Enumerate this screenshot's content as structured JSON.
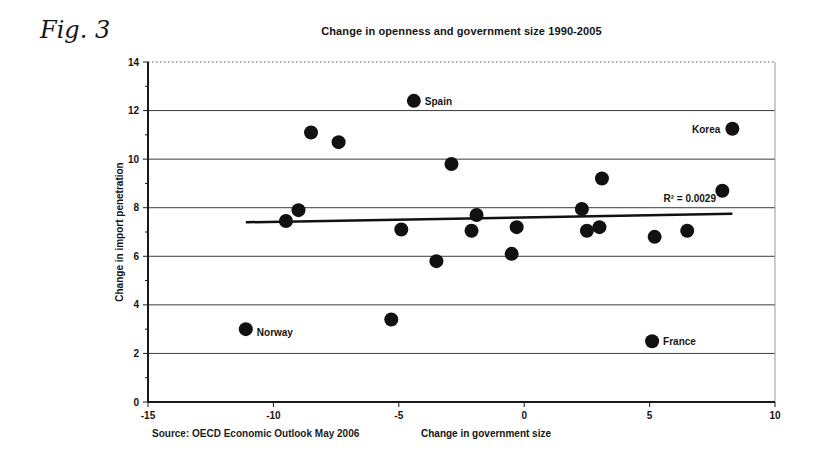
{
  "figure": {
    "caption": "Fig. 3",
    "source": "Source: OECD Economic Outlook May 2006"
  },
  "chart_data": {
    "type": "scatter",
    "title": "Change in openness and government size 1990-2005",
    "xlabel": "Change in government size",
    "ylabel": "Change in import penetration",
    "xlim": [
      -15,
      10
    ],
    "ylim": [
      0,
      14
    ],
    "x_ticks": [
      -15,
      -10,
      -5,
      0,
      5,
      10
    ],
    "y_ticks": [
      0,
      2,
      4,
      6,
      8,
      10,
      12,
      14
    ],
    "grid": "horizontal gridlines on, top line dotted, right border light",
    "legend": "none",
    "annotation": {
      "text": "R² = 0.0029",
      "x": 6.6,
      "y": 8.35
    },
    "trendline": {
      "x1": -11.1,
      "y1": 7.4,
      "x2": 8.3,
      "y2": 7.75
    },
    "points": [
      {
        "x": -11.1,
        "y": 3.0,
        "label": "Norway",
        "label_side": "right",
        "label_dy": 7
      },
      {
        "x": -9.5,
        "y": 7.45
      },
      {
        "x": -9.0,
        "y": 7.9
      },
      {
        "x": -8.5,
        "y": 11.1
      },
      {
        "x": -7.4,
        "y": 10.7
      },
      {
        "x": -5.3,
        "y": 3.4
      },
      {
        "x": -4.9,
        "y": 7.1
      },
      {
        "x": -4.4,
        "y": 12.4,
        "label": "Spain",
        "label_side": "right",
        "label_dy": 4
      },
      {
        "x": -3.5,
        "y": 5.8
      },
      {
        "x": -2.9,
        "y": 9.8
      },
      {
        "x": -2.1,
        "y": 7.05
      },
      {
        "x": -1.9,
        "y": 7.7
      },
      {
        "x": -0.5,
        "y": 6.1
      },
      {
        "x": -0.3,
        "y": 7.2
      },
      {
        "x": 2.3,
        "y": 7.95
      },
      {
        "x": 2.5,
        "y": 7.05
      },
      {
        "x": 3.0,
        "y": 7.2
      },
      {
        "x": 3.1,
        "y": 9.2
      },
      {
        "x": 5.1,
        "y": 2.5,
        "label": "France",
        "label_side": "right",
        "label_dy": 4
      },
      {
        "x": 5.2,
        "y": 6.8
      },
      {
        "x": 6.5,
        "y": 7.05
      },
      {
        "x": 7.9,
        "y": 8.7
      },
      {
        "x": 8.3,
        "y": 11.25,
        "label": "Korea",
        "label_side": "left",
        "label_dy": 4
      }
    ],
    "colors": {
      "dot": "#111111",
      "grid": "#3c3c3c",
      "grid_top": "#5a5a5a",
      "axis": "#1a1a1a",
      "right_border": "#999999",
      "trend": "#111111"
    }
  }
}
